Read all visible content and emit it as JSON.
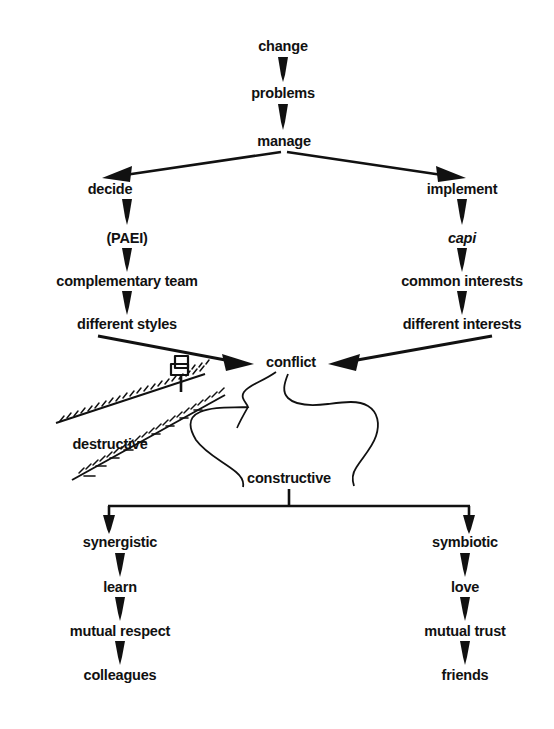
{
  "diagram": {
    "background_color": "#ffffff",
    "ink_color": "#111111",
    "nodes": {
      "change": "change",
      "problems": "problems",
      "manage": "manage",
      "decide": "decide",
      "paei": "(PAEI)",
      "complementary_team": "complementary team",
      "different_styles": "different styles",
      "implement": "implement",
      "capi": "capi",
      "common_interests": "common interests",
      "different_interests": "different interests",
      "conflict": "conflict",
      "destructive": "destructive",
      "constructive": "constructive",
      "synergistic": "synergistic",
      "learn": "learn",
      "mutual_respect": "mutual respect",
      "colleagues": "colleagues",
      "symbiotic": "symbiotic",
      "love": "love",
      "mutual_trust": "mutual trust",
      "friends": "friends"
    },
    "illustration": {
      "signpost": "signpost-icon",
      "destructive_road": "rough-road-shape",
      "constructive_road": "winding-road-shape"
    }
  }
}
